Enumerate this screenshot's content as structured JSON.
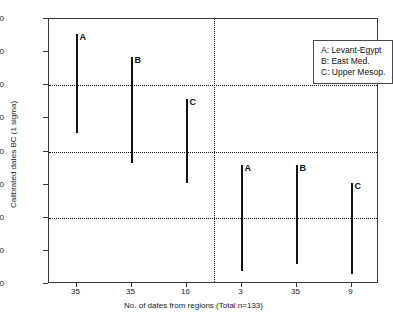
{
  "chart_data": {
    "type": "bar",
    "title": "",
    "subtitle": "",
    "xlabel": "No. of dates from regions (Total n=133)",
    "ylabel": "Calibrated dates BC (1 sigma)",
    "ylim": [
      2000,
      2800
    ],
    "y_ticks": [
      2000,
      2100,
      2200,
      2300,
      2400,
      2500,
      2600,
      2700,
      2800
    ],
    "y_tick_labels": [
      "2000",
      "2100",
      "2200",
      "2300",
      "2400",
      "2500",
      "2600",
      "2700",
      "2800"
    ],
    "gridlines": {
      "horizontal": [
        2600,
        2400,
        2200
      ],
      "vertical_divider_after_category": 3,
      "style": "dotted"
    },
    "grid": true,
    "legend_position": "top-right",
    "categories": [
      "35",
      "35",
      "16",
      "3",
      "35",
      "9"
    ],
    "x_tick_labels": [
      "35",
      "35",
      "16",
      "3",
      "35",
      "9"
    ],
    "bars": [
      {
        "label": "A",
        "group": "left",
        "x_tick": "35",
        "low": 2455,
        "high": 2755
      },
      {
        "label": "B",
        "group": "left",
        "x_tick": "35",
        "low": 2365,
        "high": 2685
      },
      {
        "label": "C",
        "group": "left",
        "x_tick": "16",
        "low": 2305,
        "high": 2560
      },
      {
        "label": "A",
        "group": "right",
        "x_tick": "3",
        "low": 2040,
        "high": 2360
      },
      {
        "label": "B",
        "group": "right",
        "x_tick": "35",
        "low": 2060,
        "high": 2360
      },
      {
        "label": "C",
        "group": "right",
        "x_tick": "9",
        "low": 2030,
        "high": 2305
      }
    ],
    "legend": [
      {
        "key": "A",
        "text": "A: Levant-Egypt"
      },
      {
        "key": "B",
        "text": "B: East Med."
      },
      {
        "key": "C",
        "text": "C: Upper Mesop."
      }
    ],
    "colors": {
      "line": "#111111",
      "frame": "#3a3a3a",
      "background": "#ffffff"
    }
  }
}
